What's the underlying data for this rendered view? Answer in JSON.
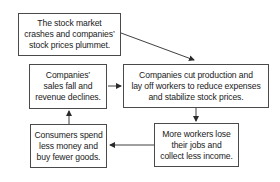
{
  "diagram": {
    "type": "cycle-flowchart",
    "nodes": [
      {
        "id": "crash",
        "lines": [
          "The stock market",
          "crashes and companies’",
          "stock prices plummet."
        ]
      },
      {
        "id": "cut",
        "lines": [
          "Companies cut production and",
          "lay off workers to reduce expenses",
          "and stabilize stock prices."
        ]
      },
      {
        "id": "lose",
        "lines": [
          "More workers lose",
          "their jobs and",
          "collect less income."
        ]
      },
      {
        "id": "spend",
        "lines": [
          "Consumers spend",
          "less money and",
          "buy fewer goods."
        ]
      },
      {
        "id": "sales",
        "lines": [
          "Companies’",
          "sales fall and",
          "revenue declines."
        ]
      }
    ],
    "edges": [
      {
        "from": "crash",
        "to": "cut"
      },
      {
        "from": "cut",
        "to": "lose"
      },
      {
        "from": "lose",
        "to": "spend"
      },
      {
        "from": "spend",
        "to": "sales"
      },
      {
        "from": "sales",
        "to": "cut"
      }
    ],
    "colors": {
      "border": "#4a4a4a",
      "text": "#1a1a1a",
      "arrow": "#2a2a2a",
      "background": "#ffffff"
    }
  }
}
